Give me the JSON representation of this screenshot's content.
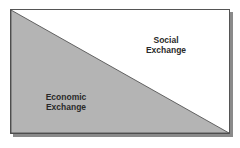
{
  "diagram": {
    "regions": [
      {
        "id": "social",
        "label_line1": "Social",
        "label_line2": "Exchange",
        "fill": "#ffffff"
      },
      {
        "id": "economic",
        "label_line1": "Economic",
        "label_line2": "Exchange",
        "fill": "#b4b4b4"
      }
    ],
    "colors": {
      "border": "#555555",
      "shadow": "#8a8a8a",
      "text": "#2a2a2a"
    }
  }
}
